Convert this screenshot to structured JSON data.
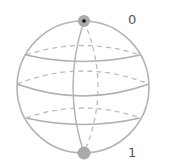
{
  "diagram": {
    "type": "bloch-sphere",
    "colors": {
      "outline": "#b4b4b4",
      "dashed": "#b8b8b8",
      "point": "#a9a9a9",
      "point_center": "#111111",
      "label": "#555555"
    },
    "sphere": {
      "cx": 83,
      "cy": 87,
      "rx": 66,
      "ry": 66
    },
    "labels": {
      "top": "0",
      "bottom": "1"
    },
    "points": [
      {
        "name": "north-pole",
        "x": 84,
        "y": 21,
        "r": 6,
        "has_center_dot": true
      },
      {
        "name": "south-pole",
        "x": 84,
        "y": 153,
        "r": 6,
        "has_center_dot": false
      }
    ]
  }
}
